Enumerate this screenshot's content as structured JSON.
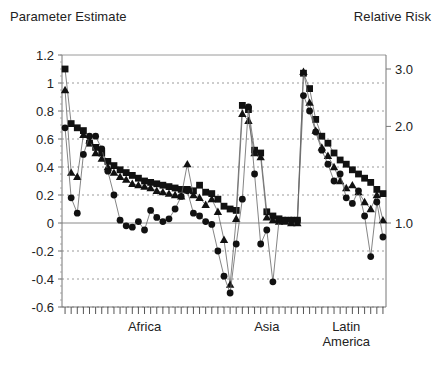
{
  "figure": {
    "left_axis_title": "Parameter Estimate",
    "right_axis_title": "Relative Risk"
  },
  "chart_data": {
    "type": "line",
    "title": "",
    "subtitle": "",
    "xlabel": "",
    "ylabel": "Parameter Estimate",
    "y2label": "Relative Risk",
    "grid": true,
    "legend": "none",
    "ylim": [
      -0.6,
      1.2
    ],
    "yticks": [
      1.2,
      1.0,
      0.8,
      0.6,
      0.4,
      0.2,
      0.0,
      -0.2,
      -0.4,
      -0.6
    ],
    "ytick_labels": [
      "1.2",
      "1",
      "0.8",
      "0.6",
      "0.4",
      "0.2",
      "0",
      "-0.2",
      "-0.4",
      "-0.6"
    ],
    "y2ticks": [
      3.0,
      2.0,
      1.0
    ],
    "y2tick_labels": [
      "3.0",
      "2.0",
      "1.0"
    ],
    "y2_tick_parameter_values": [
      1.1,
      0.69,
      0.0
    ],
    "y2_scale": "log",
    "y2_note": "Relative Risk = exp(Parameter Estimate)",
    "x": [
      1,
      2,
      3,
      4,
      5,
      6,
      7,
      8,
      9,
      10,
      11,
      12,
      13,
      14,
      15,
      16,
      17,
      18,
      19,
      20,
      21,
      22,
      23,
      24,
      25,
      26,
      27,
      28,
      29,
      30,
      31,
      32,
      33,
      34,
      35,
      36,
      37,
      38,
      39,
      40,
      41,
      42,
      43,
      44,
      45,
      46,
      47,
      48,
      49,
      50,
      51,
      52,
      53
    ],
    "xtick_count": 53,
    "xtick_labels_shown": false,
    "group_labels": [
      "Africa",
      "Asia",
      "Latin America"
    ],
    "groups": [
      {
        "label": "Africa",
        "x_start": 1,
        "x_end": 29,
        "center_x": 14
      },
      {
        "label": "Asia",
        "x_start": 30,
        "x_end": 39,
        "center_x": 34
      },
      {
        "label": "Latin America",
        "x_start": 40,
        "x_end": 53,
        "center_x": 47
      }
    ],
    "series": [
      {
        "name": "series-squares",
        "marker": "square",
        "color": "#111111",
        "values": [
          1.1,
          0.71,
          0.68,
          0.66,
          0.57,
          0.54,
          0.5,
          0.44,
          0.41,
          0.38,
          0.36,
          0.34,
          0.32,
          0.3,
          0.29,
          0.28,
          0.27,
          0.26,
          0.25,
          0.24,
          0.24,
          0.23,
          0.27,
          0.22,
          0.21,
          0.17,
          0.12,
          0.1,
          0.09,
          0.84,
          0.81,
          0.52,
          0.5,
          0.08,
          0.05,
          0.03,
          0.02,
          0.02,
          0.02,
          1.07,
          0.96,
          0.74,
          0.62,
          0.57,
          0.5,
          0.45,
          0.42,
          0.38,
          0.35,
          0.32,
          0.29,
          0.24,
          0.21
        ]
      },
      {
        "name": "series-triangles",
        "marker": "triangle",
        "color": "#111111",
        "values": [
          0.95,
          0.36,
          0.33,
          0.63,
          0.59,
          0.5,
          0.46,
          0.4,
          0.36,
          0.33,
          0.31,
          0.28,
          0.27,
          0.26,
          0.25,
          0.23,
          0.22,
          0.21,
          0.2,
          0.19,
          0.42,
          0.2,
          0.18,
          0.13,
          0.17,
          0.08,
          -0.12,
          -0.44,
          0.03,
          0.78,
          0.73,
          0.5,
          0.47,
          0.04,
          0.02,
          0.01,
          0.01,
          0.0,
          0.0,
          1.08,
          0.86,
          0.66,
          0.54,
          0.48,
          0.4,
          0.3,
          0.25,
          0.27,
          0.22,
          0.15,
          0.1,
          0.2,
          0.02
        ]
      },
      {
        "name": "series-circles",
        "marker": "circle",
        "color": "#111111",
        "values": [
          0.68,
          0.18,
          0.07,
          0.49,
          0.62,
          0.62,
          0.53,
          0.37,
          0.2,
          0.02,
          -0.02,
          -0.03,
          0.01,
          -0.05,
          0.09,
          0.04,
          0.01,
          0.03,
          0.1,
          0.19,
          0.23,
          0.07,
          0.05,
          0.01,
          -0.01,
          -0.2,
          -0.38,
          -0.5,
          -0.15,
          0.17,
          0.83,
          0.35,
          -0.15,
          -0.05,
          -0.42,
          0.02,
          0.02,
          0.02,
          0.02,
          0.91,
          0.8,
          0.65,
          0.52,
          0.42,
          0.3,
          0.35,
          0.18,
          0.14,
          0.23,
          0.05,
          -0.24,
          0.15,
          -0.1
        ]
      }
    ]
  }
}
